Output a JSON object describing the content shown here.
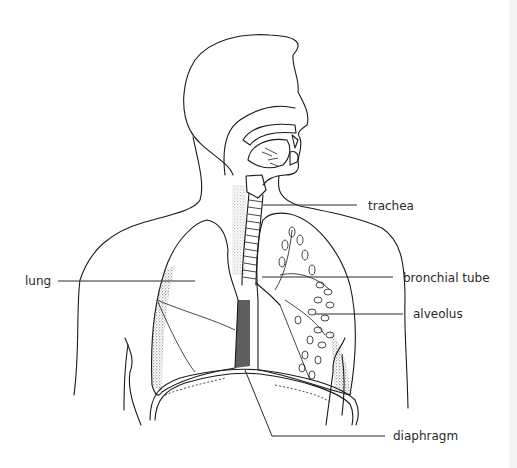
{
  "diagram": {
    "labels": [
      {
        "id": "trachea",
        "text": "trachea"
      },
      {
        "id": "lung",
        "text": "lung"
      },
      {
        "id": "bronchial-tube",
        "text": "bronchial tube"
      },
      {
        "id": "alveolus",
        "text": "alveolus"
      },
      {
        "id": "diaphragm",
        "text": "diaphragm"
      }
    ],
    "colors": {
      "line": "#1a1a1a",
      "text": "#2a2a2a",
      "background": "#ffffff",
      "stipple": "#333333"
    }
  }
}
